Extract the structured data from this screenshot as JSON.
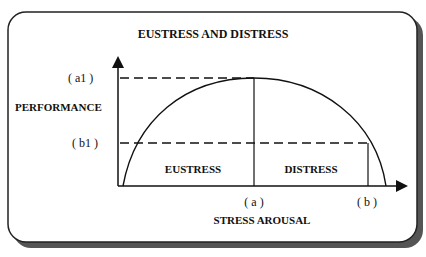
{
  "diagram": {
    "title": "EUSTRESS AND DISTRESS",
    "y_axis_label": "PERFORMANCE",
    "x_axis_label": "STRESS AROUSAL",
    "y_ticks": {
      "a1": "( a1 )",
      "b1": "( b1 )"
    },
    "x_ticks": {
      "a": "( a )",
      "b": "( b )"
    },
    "regions": {
      "left": "EUSTRESS",
      "right": "DISTRESS"
    },
    "colors": {
      "line": "#111111",
      "frame_shadow": "#555555",
      "background": "#ffffff"
    }
  }
}
